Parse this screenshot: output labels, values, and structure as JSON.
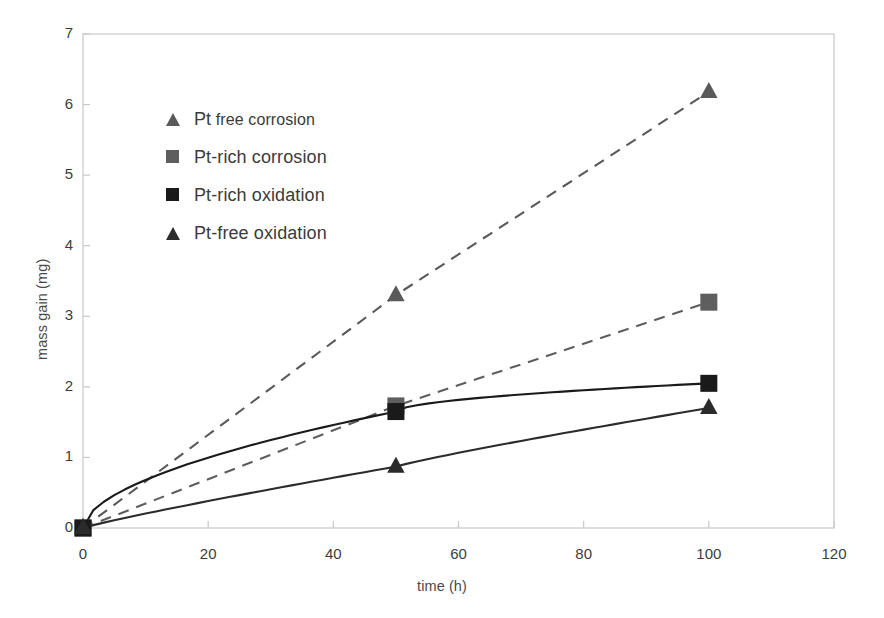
{
  "chart_data": {
    "type": "line",
    "title": "",
    "xlabel": "time (h)",
    "ylabel": "mass gain (mg)",
    "xlim": [
      0,
      120
    ],
    "ylim": [
      0,
      7
    ],
    "xticks": [
      0,
      20,
      40,
      60,
      80,
      100,
      120
    ],
    "yticks": [
      0,
      1,
      2,
      3,
      4,
      5,
      6,
      7
    ],
    "grid": false,
    "legend_position": "upper-left-inside",
    "x": [
      0,
      50,
      100
    ],
    "series": [
      {
        "name": "Pt free corrosion",
        "label_lead": "Pt",
        "label_rest": "free corrosion",
        "values": [
          0,
          3.3,
          6.18
        ],
        "marker": "triangle",
        "linestyle": "dashed",
        "color": "#5a5a5a",
        "curve": "linear"
      },
      {
        "name": "Pt-rich corrosion",
        "label_lead": "Pt-rich corrosion",
        "label_rest": "",
        "values": [
          0,
          1.73,
          3.2
        ],
        "marker": "square",
        "linestyle": "dashed",
        "color": "#5e5e5e",
        "curve": "linear"
      },
      {
        "name": "Pt-rich oxidation",
        "label_lead": "Pt-rich oxidation",
        "label_rest": "",
        "values": [
          0,
          1.65,
          2.05
        ],
        "marker": "square",
        "linestyle": "solid",
        "color": "#1a1a1a",
        "curve": "parabolic"
      },
      {
        "name": "Pt-free oxidation",
        "label_lead": "Pt-free oxidation",
        "label_rest": "",
        "values": [
          0,
          0.87,
          1.7
        ],
        "marker": "triangle",
        "linestyle": "solid",
        "color": "#2b2b2b",
        "curve": "slight"
      }
    ]
  },
  "axes": {
    "frame_color": "#cfcfcf",
    "tick_color": "#c8c8c8"
  }
}
